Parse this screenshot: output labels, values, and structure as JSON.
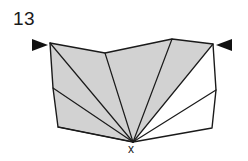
{
  "figure": {
    "number_label": "13",
    "apex_label": "x",
    "background_color": "#ffffff",
    "stroke_color": "#1a1a1a",
    "shaded_fill": "#d2d2d2",
    "unshaded_fill": "#ffffff",
    "stroke_width": 1.2
  },
  "geometry": {
    "apex": {
      "x": 133,
      "y": 142
    },
    "outline_points": "50,43 105,53 172,39 213,44 216,90 212,128 133,142 58,127 53,88",
    "boundary_vertices": [
      {
        "name": "top-left-corner",
        "x": 50,
        "y": 43
      },
      {
        "name": "top-notch",
        "x": 105,
        "y": 53
      },
      {
        "name": "top-peak",
        "x": 172,
        "y": 39
      },
      {
        "name": "top-right-corner",
        "x": 213,
        "y": 44
      },
      {
        "name": "right-bend",
        "x": 216,
        "y": 90
      },
      {
        "name": "bottom-right-corner",
        "x": 212,
        "y": 128
      },
      {
        "name": "apex-x",
        "x": 133,
        "y": 142
      },
      {
        "name": "bottom-left-corner",
        "x": 58,
        "y": 127
      },
      {
        "name": "left-bend",
        "x": 53,
        "y": 88
      }
    ],
    "fan_triangles": [
      {
        "name": "triangle-1",
        "points": "133,142 50,43 105,53",
        "fill": "shaded"
      },
      {
        "name": "triangle-2",
        "points": "133,142 105,53 172,39",
        "fill": "shaded"
      },
      {
        "name": "triangle-3",
        "points": "133,142 172,39 213,44",
        "fill": "shaded"
      },
      {
        "name": "triangle-4",
        "points": "133,142 213,44 216,90",
        "fill": "unshaded"
      },
      {
        "name": "triangle-5",
        "points": "133,142 216,90 212,128",
        "fill": "unshaded"
      },
      {
        "name": "triangle-6",
        "points": "133,142 53,88 50,43",
        "fill": "shaded"
      },
      {
        "name": "triangle-7",
        "points": "133,142 58,127 53,88",
        "fill": "shaded"
      }
    ],
    "fan_diagonals": [
      {
        "name": "diagonal-to-top-left",
        "x2": 50,
        "y2": 43
      },
      {
        "name": "diagonal-to-top-notch",
        "x2": 105,
        "y2": 53
      },
      {
        "name": "diagonal-to-top-peak",
        "x2": 172,
        "y2": 39
      },
      {
        "name": "diagonal-to-top-right",
        "x2": 213,
        "y2": 44
      },
      {
        "name": "diagonal-to-right-bend",
        "x2": 216,
        "y2": 90
      },
      {
        "name": "diagonal-to-left-bend",
        "x2": 53,
        "y2": 88
      },
      {
        "name": "diagonal-to-bottom-left",
        "x2": 58,
        "y2": 127
      }
    ]
  },
  "markers": {
    "left_arrow": {
      "icon": "triangle-right-icon",
      "points": "32,39 48,45 32,51",
      "direction": "right"
    },
    "right_arrow": {
      "icon": "triangle-left-icon",
      "points": "232,39 216,45 232,51",
      "direction": "left"
    }
  }
}
